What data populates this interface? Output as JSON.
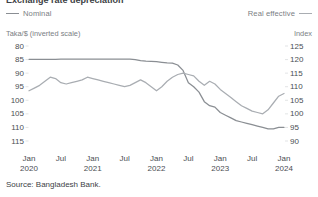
{
  "title": "Exchange rate depreciation",
  "legend": [
    {
      "label": "Nominal",
      "color": "#8a8e93",
      "icon": "line-swatch-icon",
      "position": "left"
    },
    {
      "label": "Real effective",
      "color": "#a9adb2",
      "icon": "line-swatch-icon",
      "position": "right"
    }
  ],
  "axis_units": {
    "left": "Taka/$ (inverted scale)",
    "right": "Index"
  },
  "source": "Source: Bangladesh Bank.",
  "chart_data": {
    "type": "line",
    "title": "Exchange rate depreciation",
    "xlabel": "",
    "ylabel": "Taka/$ (inverted scale)",
    "y2label": "Index",
    "grid": false,
    "legend_position": "top",
    "ylim": [
      115,
      80
    ],
    "y_inverted": true,
    "yticks": [
      80,
      85,
      90,
      95,
      100,
      105,
      110,
      115
    ],
    "y2lim": [
      90,
      125
    ],
    "y2ticks": [
      125,
      120,
      115,
      110,
      105,
      100,
      95,
      90
    ],
    "xticks": [
      "Jan 2020",
      "Jul",
      "Jan 2021",
      "Jul",
      "Jan 2022",
      "Jul",
      "Jan 2023",
      "Jul",
      "Jan 2024"
    ],
    "xtick_lines": [
      [
        "Jan",
        "2020"
      ],
      [
        "Jul",
        ""
      ],
      [
        "Jan",
        "2021"
      ],
      [
        "Jul",
        ""
      ],
      [
        "Jan",
        "2022"
      ],
      [
        "Jul",
        ""
      ],
      [
        "Jan",
        "2023"
      ],
      [
        "Jul",
        ""
      ],
      [
        "Jan",
        "2024"
      ]
    ],
    "xlim": [
      "2020-01",
      "2024-01"
    ],
    "x": [
      "2020-01",
      "2020-02",
      "2020-03",
      "2020-04",
      "2020-05",
      "2020-06",
      "2020-07",
      "2020-08",
      "2020-09",
      "2020-10",
      "2020-11",
      "2020-12",
      "2021-01",
      "2021-02",
      "2021-03",
      "2021-04",
      "2021-05",
      "2021-06",
      "2021-07",
      "2021-08",
      "2021-09",
      "2021-10",
      "2021-11",
      "2021-12",
      "2022-01",
      "2022-02",
      "2022-03",
      "2022-04",
      "2022-05",
      "2022-06",
      "2022-07",
      "2022-08",
      "2022-09",
      "2022-10",
      "2022-11",
      "2022-12",
      "2023-01",
      "2023-02",
      "2023-03",
      "2023-04",
      "2023-05",
      "2023-06",
      "2023-07",
      "2023-08",
      "2023-09",
      "2023-10",
      "2023-11",
      "2023-12",
      "2024-01"
    ],
    "series": [
      {
        "name": "Nominal",
        "axis": "left",
        "color": "#8a8e93",
        "unit": "Taka/$",
        "values": [
          84.9,
          84.9,
          84.9,
          84.9,
          84.9,
          84.9,
          84.8,
          84.8,
          84.8,
          84.8,
          84.8,
          84.8,
          84.8,
          84.8,
          84.8,
          84.8,
          84.8,
          84.8,
          84.8,
          84.8,
          85.0,
          85.4,
          85.6,
          85.7,
          85.8,
          86.0,
          86.2,
          86.3,
          87.0,
          89.0,
          93.5,
          95.0,
          97.0,
          100.5,
          102.0,
          102.5,
          104.5,
          105.5,
          106.5,
          107.5,
          108.0,
          108.5,
          109.0,
          109.5,
          110.0,
          110.5,
          110.5,
          110.0,
          110.0
        ]
      },
      {
        "name": "Real effective",
        "axis": "right",
        "color": "#a9adb2",
        "unit": "Index",
        "values": [
          108.5,
          109.5,
          110.5,
          112.0,
          113.5,
          113.0,
          111.5,
          111.0,
          111.5,
          112.0,
          112.5,
          113.5,
          113.0,
          112.5,
          112.0,
          111.5,
          111.0,
          110.5,
          110.0,
          110.5,
          111.5,
          112.5,
          111.5,
          110.0,
          108.5,
          110.0,
          112.0,
          113.5,
          114.5,
          115.0,
          114.5,
          114.0,
          112.0,
          110.5,
          112.0,
          111.0,
          109.0,
          107.5,
          106.0,
          104.5,
          103.0,
          102.0,
          101.0,
          100.5,
          100.0,
          101.5,
          104.0,
          106.5,
          107.5
        ]
      }
    ],
    "series_crossover_note": "Both series decline sharply from mid-2022; real effective rebounds in late 2023."
  }
}
